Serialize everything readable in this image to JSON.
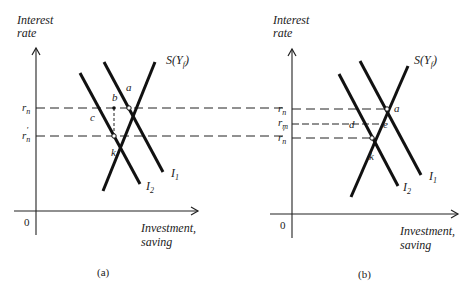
{
  "figure": {
    "panels": [
      {
        "id": "a",
        "caption": "(a)",
        "y_axis_label_line1": "Interest",
        "y_axis_label_line2": "rate",
        "x_axis_label_line1": "Investment,",
        "x_axis_label_line2": "saving",
        "origin_label": "0",
        "saving_curve": "S(Y",
        "saving_curve_sub": "f",
        "saving_curve_close": ")",
        "investment_curves": [
          {
            "label": "I",
            "sub": "1"
          },
          {
            "label": "I",
            "sub": "2"
          }
        ],
        "rate_levels": [
          {
            "label": "r",
            "sub": "n",
            "prime": ""
          },
          {
            "label": "r",
            "sub": "n",
            "prime": "′"
          }
        ],
        "points": {
          "a": "a",
          "b": "b",
          "c": "c",
          "k": "k"
        }
      },
      {
        "id": "b",
        "caption": "(b)",
        "y_axis_label_line1": "Interest",
        "y_axis_label_line2": "rate",
        "x_axis_label_line1": "Investment,",
        "x_axis_label_line2": "saving",
        "origin_label": "0",
        "saving_curve": "S(Y",
        "saving_curve_sub": "f",
        "saving_curve_close": ")",
        "investment_curves": [
          {
            "label": "I",
            "sub": "1"
          },
          {
            "label": "I",
            "sub": "2"
          }
        ],
        "rate_levels": [
          {
            "label": "r",
            "sub": "n",
            "prime": ""
          },
          {
            "label": "r",
            "sub": "m",
            "prime": ""
          },
          {
            "label": "r",
            "sub": "n",
            "prime": "′"
          }
        ],
        "points": {
          "a": "a",
          "d": "d",
          "e": "e",
          "k": "k"
        }
      }
    ],
    "colors": {
      "ink": "#111111",
      "background": "#ffffff"
    }
  }
}
